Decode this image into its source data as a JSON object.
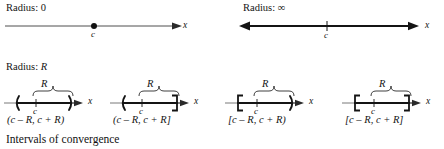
{
  "figure": {
    "caption": "Intervals of convergence",
    "axis_variable": "x",
    "center_label": "c",
    "radius_label": "R",
    "stroke_color": "#1a1a1a",
    "background_color": "#ffffff"
  },
  "panels": {
    "radius_zero": {
      "heading_prefix": "Radius:",
      "heading_value": "0",
      "axis_label": "x",
      "center_label": "c",
      "marker": "filled-dot",
      "left_end": "plain",
      "right_end": "arrow"
    },
    "radius_infinity": {
      "heading_prefix": "Radius:",
      "heading_value": "∞",
      "axis_label": "x",
      "center_label": "c",
      "marker": "tick",
      "left_end": "arrow",
      "right_end": "arrow"
    },
    "radius_r": {
      "heading_prefix": "Radius:",
      "heading_value": "R",
      "intervals": [
        {
          "id": "open-open",
          "notation": "(c – R, c + R)",
          "left_bracket": "(",
          "right_bracket": ")",
          "brace_label": "R",
          "axis_label": "x",
          "center_label": "c"
        },
        {
          "id": "open-closed",
          "notation": "(c – R, c + R]",
          "left_bracket": "(",
          "right_bracket": "]",
          "brace_label": "R",
          "axis_label": "x",
          "center_label": "c"
        },
        {
          "id": "closed-open",
          "notation": "[c – R, c + R)",
          "left_bracket": "[",
          "right_bracket": ")",
          "brace_label": "R",
          "axis_label": "x",
          "center_label": "c"
        },
        {
          "id": "closed-closed",
          "notation": "[c – R, c + R]",
          "left_bracket": "[",
          "right_bracket": "]",
          "brace_label": "R",
          "axis_label": "x",
          "center_label": "c"
        }
      ]
    }
  }
}
